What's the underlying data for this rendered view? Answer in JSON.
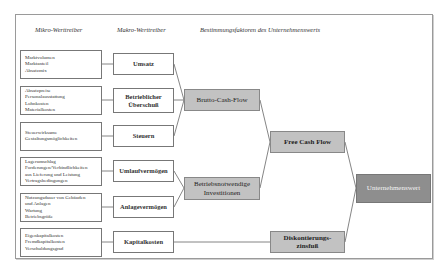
{
  "headers": {
    "micro": "Mikro-Werttreiber",
    "macro": "Makro-Werttreiber",
    "determinants": "Bestimmungsfaktoren des Unternehmenswerts"
  },
  "micro_drivers": [
    {
      "lines": [
        "Marktvolumen",
        "Marktanteil",
        "Absatzmix"
      ]
    },
    {
      "lines": [
        "Absatzpreise",
        "Personalausstattung",
        "Lohnkosten",
        "Materialkosten"
      ]
    },
    {
      "lines": [
        "Steuerwirksame",
        "Gestaltungsmöglichkeiten"
      ]
    },
    {
      "lines": [
        "Lagerumschlag",
        "Forderungen/Verbindlichkeiten",
        "aus Lieferung und Leistung",
        "Vertragsbedingungen"
      ]
    },
    {
      "lines": [
        "Nutzungsdauer von Gebäuden",
        "und Anlagen",
        "Wartung",
        "Betriebsgröße"
      ]
    },
    {
      "lines": [
        "Eigenkapitalkosten",
        "Fremdkapitalkosten",
        "Verschuldungsgrad"
      ]
    }
  ],
  "macro_drivers": [
    {
      "label": "Umsatz"
    },
    {
      "label": "Betrieblicher Überschuß"
    },
    {
      "label": "Steuern"
    },
    {
      "label": "Umlaufvermögen"
    },
    {
      "label": "Anlagevermögen"
    },
    {
      "label": "Kapitalkosten"
    }
  ],
  "determinants": {
    "brutto_cash_flow": "Brutto-Cash-Flow",
    "investments": "Betriebsnotwendige Investitionen",
    "free_cash_flow": "Free Cash Flow",
    "discount_rate": "Diskontierungs- zinsfuß",
    "enterprise_value": "Unternehmenswert"
  },
  "colors": {
    "box_fill": "#c2c2c2",
    "final_fill": "#8e8e8e",
    "line": "#777777"
  }
}
